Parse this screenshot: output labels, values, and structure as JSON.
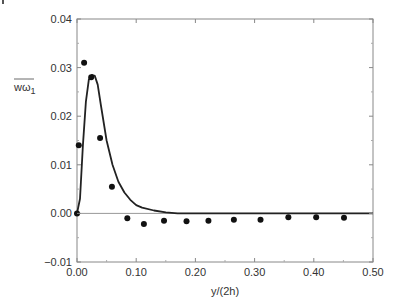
{
  "chart_data": {
    "type": "scatter",
    "title": "",
    "xlabel": "y/(2h)",
    "ylabel": "wω1",
    "ylabel_main": "wω",
    "ylabel_sub": "1",
    "xlim": [
      0.0,
      0.5
    ],
    "ylim": [
      -0.01,
      0.04
    ],
    "x_ticks": [
      "0.00",
      "0.10",
      "0.20",
      "0.30",
      "0.40",
      "0.50"
    ],
    "y_ticks": [
      "−0.01",
      "0.00",
      "0.01",
      "0.02",
      "0.03",
      "0.04"
    ],
    "grid": false,
    "legend": null,
    "series": [
      {
        "name": "data points",
        "kind": "scatter",
        "x": [
          0.0,
          0.003,
          0.012,
          0.024,
          0.039,
          0.059,
          0.085,
          0.113,
          0.147,
          0.185,
          0.222,
          0.265,
          0.31,
          0.357,
          0.404,
          0.451
        ],
        "y": [
          0.0,
          0.014,
          0.031,
          0.028,
          0.0155,
          0.0055,
          -0.001,
          -0.0022,
          -0.0015,
          -0.0016,
          -0.0015,
          -0.0013,
          -0.0013,
          -0.0008,
          -0.0008,
          -0.0009
        ]
      },
      {
        "name": "model curve",
        "kind": "line",
        "x": [
          0.0,
          0.005,
          0.01,
          0.015,
          0.02,
          0.025,
          0.03,
          0.035,
          0.04,
          0.05,
          0.06,
          0.07,
          0.08,
          0.09,
          0.1,
          0.11,
          0.13,
          0.15,
          0.17,
          0.2,
          0.3,
          0.4,
          0.5
        ],
        "y": [
          0.0,
          0.003,
          0.014,
          0.023,
          0.0275,
          0.0285,
          0.0283,
          0.0265,
          0.0225,
          0.015,
          0.01,
          0.0065,
          0.0043,
          0.0028,
          0.0017,
          0.0012,
          0.0006,
          0.0002,
          0.0,
          0.0,
          0.0,
          0.0,
          0.0
        ]
      }
    ]
  }
}
